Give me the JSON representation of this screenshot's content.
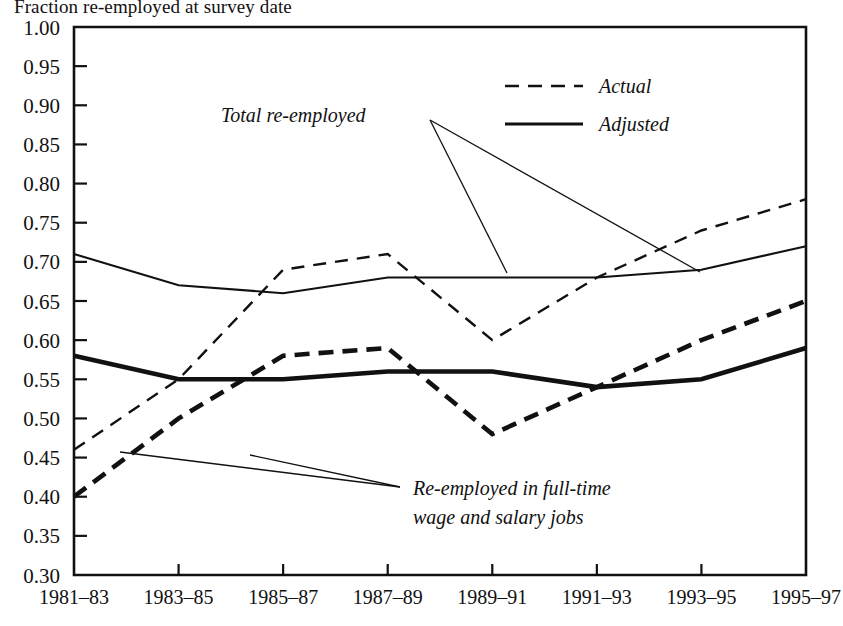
{
  "chart_data": {
    "type": "line",
    "title": "Fraction re-employed at survey date",
    "xlabel": "",
    "ylabel": "",
    "ylim": [
      0.3,
      1.0
    ],
    "ytick_step": 0.05,
    "grid": false,
    "legend_position": "top-right",
    "categories": [
      "1981–83",
      "1983–85",
      "1985–87",
      "1987–89",
      "1989–91",
      "1991–93",
      "1993–95",
      "1995–97"
    ],
    "yticks": [
      "1.00",
      "0.95",
      "0.90",
      "0.85",
      "0.80",
      "0.75",
      "0.70",
      "0.65",
      "0.60",
      "0.55",
      "0.50",
      "0.45",
      "0.40",
      "0.35",
      "0.30"
    ],
    "legend": [
      {
        "label": "Actual",
        "style": "dashed"
      },
      {
        "label": "Adjusted",
        "style": "solid"
      }
    ],
    "annotations": [
      {
        "text": "Total re-employed",
        "group": "total"
      },
      {
        "text": "Re-employed in full-time",
        "group": "fulltime-line1"
      },
      {
        "text": "wage and salary jobs",
        "group": "fulltime-line2"
      }
    ],
    "series": [
      {
        "name": "Total re-employed — Actual",
        "group": "total",
        "style": "dashed",
        "weight": "thin",
        "values": [
          0.46,
          0.55,
          0.69,
          0.71,
          0.6,
          0.68,
          0.74,
          0.78
        ]
      },
      {
        "name": "Total re-employed — Adjusted",
        "group": "total",
        "style": "solid",
        "weight": "thin",
        "values": [
          0.71,
          0.67,
          0.66,
          0.68,
          0.68,
          0.68,
          0.69,
          0.72
        ]
      },
      {
        "name": "Re-employed in full-time wage and salary jobs — Actual",
        "group": "fulltime",
        "style": "dashed",
        "weight": "thick",
        "values": [
          0.4,
          0.5,
          0.58,
          0.59,
          0.48,
          0.54,
          0.6,
          0.65
        ]
      },
      {
        "name": "Re-employed in full-time wage and salary jobs — Adjusted",
        "group": "fulltime",
        "style": "solid",
        "weight": "thick",
        "values": [
          0.58,
          0.55,
          0.55,
          0.56,
          0.56,
          0.54,
          0.55,
          0.59
        ]
      }
    ]
  }
}
